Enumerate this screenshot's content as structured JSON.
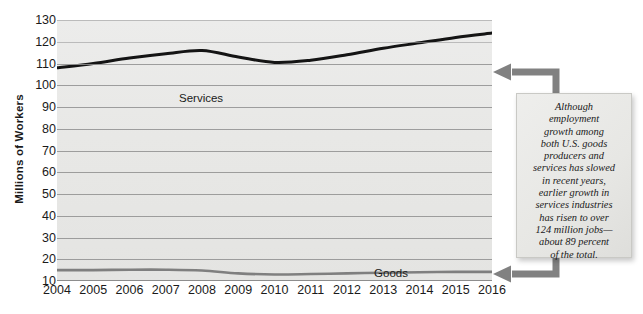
{
  "chart_data": {
    "type": "line",
    "title": "",
    "subtitle": "",
    "xlabel": "",
    "ylabel": "Millions of Workers",
    "grid": true,
    "legend_position": "inline-labels",
    "x": [
      "2004",
      "2005",
      "2006",
      "2007",
      "2008",
      "2009",
      "2010",
      "2011",
      "2012",
      "2013",
      "2014",
      "2015",
      "2016"
    ],
    "xlim": [
      2004,
      2016
    ],
    "ylim": [
      10,
      130
    ],
    "yticks": [
      130,
      120,
      110,
      100,
      90,
      80,
      70,
      60,
      50,
      40,
      30,
      20,
      10
    ],
    "xticks": [
      "2004",
      "2005",
      "2006",
      "2007",
      "2008",
      "2009",
      "2010",
      "2011",
      "2012",
      "2013",
      "2014",
      "2015",
      "2016"
    ],
    "series": [
      {
        "name": "Services",
        "color": "#141414",
        "values": [
          108,
          110,
          112.5,
          114.5,
          116,
          113,
          110.5,
          111.5,
          114,
          117,
          119.5,
          122,
          124
        ]
      },
      {
        "name": "Goods Production",
        "color": "#7f7f7f",
        "values": [
          15,
          15,
          15.2,
          15.2,
          14.8,
          13.5,
          13,
          13.2,
          13.5,
          13.8,
          14,
          14.2,
          14.2
        ]
      }
    ],
    "annotations": [
      {
        "name": "callout",
        "text": "Although\nemployment\ngrowth among\nboth U.S. goods\nproducers and\nservices has slowed\nin recent years,\nearlier growth in\nservices industries\nhas risen to over\n124 million jobs—\nabout 89 percent\nof the total.",
        "points_to": [
          "Services",
          "Goods Production"
        ]
      }
    ]
  },
  "axis": {
    "y_title": "Millions of Workers",
    "y_ticks": [
      "130",
      "120",
      "110",
      "100",
      "90",
      "80",
      "70",
      "60",
      "50",
      "40",
      "30",
      "20",
      "10"
    ],
    "x_ticks": [
      "2004",
      "2005",
      "2006",
      "2007",
      "2008",
      "2009",
      "2010",
      "2011",
      "2012",
      "2013",
      "2014",
      "2015",
      "2016"
    ]
  },
  "series_labels": {
    "services": "Services",
    "goods_line1": "Goods",
    "goods_line2": "Production"
  },
  "callout": {
    "text": "Although\nemployment\ngrowth among\nboth U.S. goods\nproducers and\nservices has slowed\nin recent years,\nearlier growth in\nservices industries\nhas risen to over\n124 million jobs—\nabout 89 percent\nof the total."
  },
  "colors": {
    "services_line": "#141414",
    "goods_line": "#7f7f7f",
    "plot_background": "#e8e8e6",
    "gridline": "#8f8f8f",
    "arrow": "#808080",
    "callout_background": "#e7e7e4",
    "text": "#1a1a1a"
  }
}
